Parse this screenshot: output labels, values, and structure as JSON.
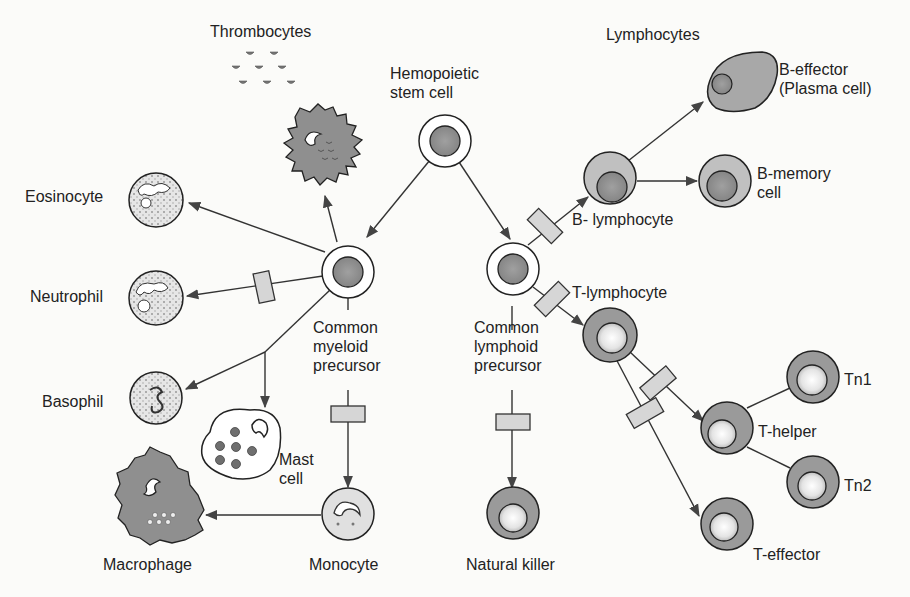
{
  "diagram": {
    "colors": {
      "line": "#2a2a2a",
      "cell_fill": "#9a9a9a",
      "nucleus_fill": "#7a7a7a",
      "light_fill": "#d8d8d8",
      "factor_box": "#d4d4d4",
      "background": "#fbfbf9"
    },
    "labels": {
      "thrombocytes": "Thrombocytes",
      "hemopoietic_stem_cell": "Hemopoietic\nstem cell",
      "lymphocytes": "Lymphocytes",
      "b_effector": "B-effector\n(Plasma cell)",
      "b_memory": "B-memory\ncell",
      "b_lymphocyte": "B- lymphocyte",
      "t_lymphocyte": "T-lymphocyte",
      "eosinocyte": "Eosinocyte",
      "neutrophil": "Neutrophil",
      "common_myeloid_precursor": "Common\nmyeloid\nprecursor",
      "common_lymphoid_precursor": "Common\nlymphoid\nprecursor",
      "basophil": "Basophil",
      "mast_cell": "Mast\ncell",
      "macrophage": "Macrophage",
      "monocyte": "Monocyte",
      "natural_killer": "Natural killer",
      "tn1": "Tn1",
      "t_helper": "T-helper",
      "tn2": "Tn2",
      "t_effector": "T-effector"
    },
    "nodes": [
      {
        "id": "hemopoietic_stem_cell",
        "label": "Hemopoietic stem cell"
      },
      {
        "id": "common_myeloid_precursor",
        "label": "Common myeloid precursor"
      },
      {
        "id": "common_lymphoid_precursor",
        "label": "Common lymphoid precursor"
      },
      {
        "id": "megakaryocyte",
        "label": ""
      },
      {
        "id": "thrombocytes",
        "label": "Thrombocytes"
      },
      {
        "id": "eosinocyte",
        "label": "Eosinocyte"
      },
      {
        "id": "neutrophil",
        "label": "Neutrophil"
      },
      {
        "id": "basophil",
        "label": "Basophil"
      },
      {
        "id": "mast_cell",
        "label": "Mast cell"
      },
      {
        "id": "monocyte",
        "label": "Monocyte"
      },
      {
        "id": "macrophage",
        "label": "Macrophage"
      },
      {
        "id": "b_lymphocyte",
        "label": "B- lymphocyte"
      },
      {
        "id": "b_effector",
        "label": "B-effector (Plasma cell)"
      },
      {
        "id": "b_memory",
        "label": "B-memory cell"
      },
      {
        "id": "t_lymphocyte",
        "label": "T-lymphocyte"
      },
      {
        "id": "t_helper",
        "label": "T-helper"
      },
      {
        "id": "tn1",
        "label": "Tn1"
      },
      {
        "id": "tn2",
        "label": "Tn2"
      },
      {
        "id": "t_effector",
        "label": "T-effector"
      },
      {
        "id": "natural_killer",
        "label": "Natural killer"
      }
    ],
    "edges": [
      {
        "from": "hemopoietic_stem_cell",
        "to": "common_myeloid_precursor",
        "factor": false
      },
      {
        "from": "hemopoietic_stem_cell",
        "to": "common_lymphoid_precursor",
        "factor": false
      },
      {
        "from": "common_myeloid_precursor",
        "to": "megakaryocyte",
        "factor": false
      },
      {
        "from": "common_myeloid_precursor",
        "to": "eosinocyte",
        "factor": false
      },
      {
        "from": "common_myeloid_precursor",
        "to": "neutrophil",
        "factor": true
      },
      {
        "from": "common_myeloid_precursor",
        "to": "basophil",
        "factor": false
      },
      {
        "from": "common_myeloid_precursor",
        "to": "mast_cell",
        "factor": false
      },
      {
        "from": "common_myeloid_precursor",
        "to": "monocyte",
        "factor": true
      },
      {
        "from": "monocyte",
        "to": "macrophage",
        "factor": false
      },
      {
        "from": "common_lymphoid_precursor",
        "to": "b_lymphocyte",
        "factor": true
      },
      {
        "from": "b_lymphocyte",
        "to": "b_effector",
        "factor": false
      },
      {
        "from": "b_lymphocyte",
        "to": "b_memory",
        "factor": false
      },
      {
        "from": "common_lymphoid_precursor",
        "to": "t_lymphocyte",
        "factor": true
      },
      {
        "from": "t_lymphocyte",
        "to": "t_helper",
        "factor": true
      },
      {
        "from": "t_lymphocyte",
        "to": "t_effector",
        "factor": true
      },
      {
        "from": "t_helper",
        "to": "tn1",
        "factor": false
      },
      {
        "from": "t_helper",
        "to": "tn2",
        "factor": false
      },
      {
        "from": "common_lymphoid_precursor",
        "to": "natural_killer",
        "factor": true
      }
    ]
  }
}
